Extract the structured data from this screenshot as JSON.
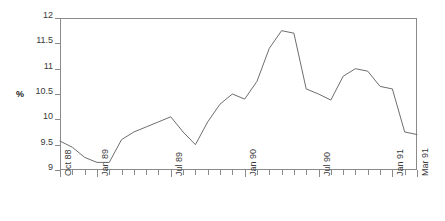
{
  "chart_data": {
    "type": "line",
    "title": "",
    "xlabel": "",
    "ylabel": "%",
    "ylim": [
      9,
      12
    ],
    "yticks": [
      9,
      9.5,
      10,
      10.5,
      11,
      11.5,
      12
    ],
    "ytick_labels": [
      "9",
      "9.5",
      "10",
      "10.5",
      "11",
      "11.5",
      "12"
    ],
    "grid": false,
    "legend": false,
    "x": [
      "Oct 88",
      "Nov 88",
      "Dec 88",
      "Jan 89",
      "Feb 89",
      "Mar 89",
      "Apr 89",
      "May 89",
      "Jun 89",
      "Jul 89",
      "Aug 89",
      "Sep 89",
      "Oct 89",
      "Nov 89",
      "Dec 89",
      "Jan 90",
      "Feb 90",
      "Mar 90",
      "Apr 90",
      "May 90",
      "Jun 90",
      "Jul 90",
      "Aug 90",
      "Sep 90",
      "Oct 90",
      "Nov 90",
      "Dec 90",
      "Jan 91",
      "Feb 91",
      "Mar 91"
    ],
    "xtick_labels": [
      {
        "index": 0,
        "label": "Oct 88"
      },
      {
        "index": 3,
        "label": "Jan 89"
      },
      {
        "index": 9,
        "label": "Jul 89"
      },
      {
        "index": 15,
        "label": "Jan 90"
      },
      {
        "index": 21,
        "label": "Jul 90"
      },
      {
        "index": 27,
        "label": "Jan 91"
      },
      {
        "index": 29,
        "label": "Mar 91"
      }
    ],
    "values": [
      9.57,
      9.45,
      9.25,
      9.15,
      9.15,
      9.6,
      9.75,
      9.85,
      9.95,
      10.05,
      9.75,
      9.5,
      9.95,
      10.3,
      10.5,
      10.4,
      10.75,
      11.4,
      11.75,
      11.7,
      10.6,
      10.5,
      10.38,
      10.85,
      11.0,
      10.95,
      10.65,
      10.6,
      9.75,
      9.7
    ],
    "series_color": "#6e6e6e",
    "axis_color": "#8a8a8a",
    "text_color": "#3a3a3a"
  }
}
